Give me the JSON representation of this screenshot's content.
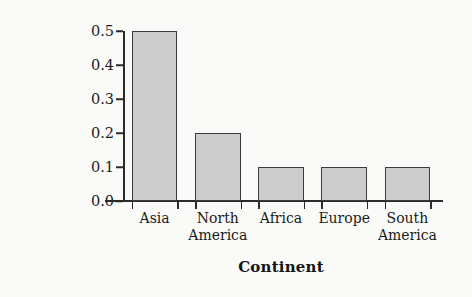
{
  "chart_data": {
    "type": "bar",
    "title": "",
    "xlabel": "Continent",
    "ylabel": "Relative frequency",
    "categories": [
      "Asia",
      "North America",
      "Africa",
      "Europe",
      "South America"
    ],
    "category_lines": [
      [
        "Asia"
      ],
      [
        "North",
        "America"
      ],
      [
        "Africa"
      ],
      [
        "Europe"
      ],
      [
        "South",
        "America"
      ]
    ],
    "values": [
      0.5,
      0.2,
      0.1,
      0.1,
      0.1
    ],
    "ylim": [
      0.0,
      0.5
    ],
    "ytick_values": [
      0.0,
      0.1,
      0.2,
      0.3,
      0.4,
      0.5
    ],
    "ytick_labels": [
      "0.0",
      "0.1",
      "0.2",
      "0.3",
      "0.4",
      "0.5"
    ],
    "grid": false,
    "legend": null,
    "bar_fill_color": "#cdcdcd",
    "bar_edge_color": "#3a3a3a",
    "axis_color": "#2b2b2b",
    "background_color": "#fafaf9"
  }
}
